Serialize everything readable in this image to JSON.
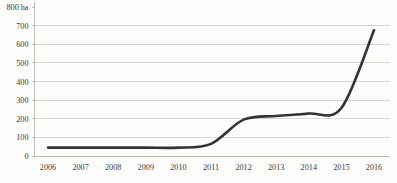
{
  "chart_data": {
    "type": "line",
    "title": "",
    "subtitle": "",
    "xlabel": "",
    "ylabel": "800 ha",
    "y_axis_unit": "ha",
    "categories": [
      "2006",
      "2007",
      "2008",
      "2009",
      "2010",
      "2011",
      "2012",
      "2013",
      "2014",
      "2015",
      "2016"
    ],
    "x": [
      2006,
      2007,
      2008,
      2009,
      2010,
      2011,
      2012,
      2013,
      2014,
      2015,
      2016
    ],
    "values": [
      45,
      45,
      45,
      45,
      45,
      65,
      195,
      215,
      228,
      258,
      675
    ],
    "series": [
      {
        "name": "Area (ha)",
        "values": [
          45,
          45,
          45,
          45,
          45,
          65,
          195,
          215,
          228,
          258,
          675
        ],
        "color": "#333333"
      }
    ],
    "ylim": [
      0,
      800
    ],
    "xlim": [
      2006,
      2016
    ],
    "y_ticks": [
      0,
      100,
      200,
      300,
      400,
      500,
      600,
      700,
      800
    ],
    "y_tick_labels": [
      "0",
      "100",
      "200",
      "300",
      "400",
      "500",
      "600",
      "700",
      "800 ha"
    ],
    "x_ticks": [
      "2006",
      "2007",
      "2008",
      "2009",
      "2010",
      "2011",
      "2012",
      "2013",
      "2014",
      "2015",
      "2016"
    ],
    "grid": true,
    "grid_axis": "y",
    "legend": false,
    "legend_position": "none",
    "annotations": [],
    "colors": {
      "line": "#333333",
      "gridline": "#c9c9c2",
      "axis": "#b0b0a8",
      "text": "#3b3b3b",
      "background": "#fdfdfb"
    }
  }
}
